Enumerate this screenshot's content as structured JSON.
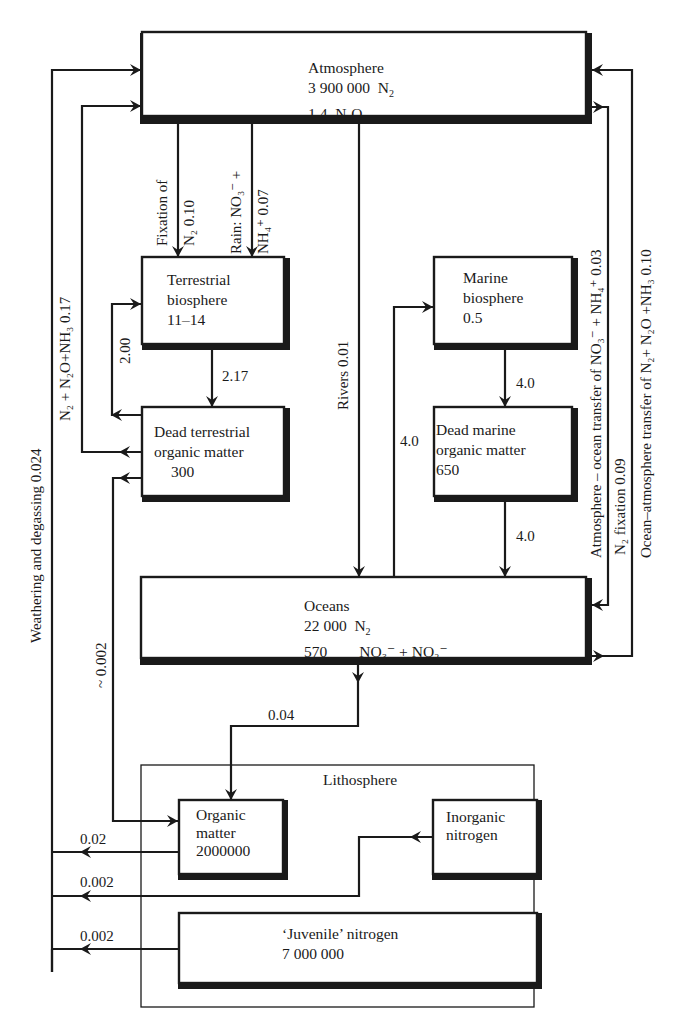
{
  "diagram": {
    "reservoirs": {
      "atmosphere": {
        "name": "Atmosphere",
        "lines": [
          {
            "value": "3 900 000",
            "species": "N",
            "sub": "2",
            "tail": ""
          },
          {
            "value": "1.4",
            "species": "N",
            "sub": "2",
            "tail": "O"
          }
        ]
      },
      "terrestrial_biosphere": {
        "line1": "Terrestrial",
        "line2": "biosphere",
        "value": "11–14"
      },
      "dead_terrestrial": {
        "line1": "Dead terrestrial",
        "line2": "organic matter",
        "value": "300"
      },
      "marine_biosphere": {
        "line1": "Marine",
        "line2": "biosphere",
        "value": "0.5"
      },
      "dead_marine": {
        "line1": "Dead marine",
        "line2": "organic matter",
        "value": "650"
      },
      "oceans": {
        "name": "Oceans",
        "n2_value": "22 000",
        "n2_label": "N",
        "n2_sub": "2",
        "nox_value": "570",
        "nox_label": "NO₃⁻ + NO₂⁻"
      },
      "lithosphere": {
        "name": "Lithosphere"
      },
      "organic_matter": {
        "line1": "Organic",
        "line2": "matter",
        "value": "2000000"
      },
      "inorganic_nitrogen": {
        "line1": "Inorganic",
        "line2": "nitrogen"
      },
      "juvenile_nitrogen": {
        "name": "‘Juvenile’ nitrogen",
        "value": "7 000 000"
      }
    },
    "flows": {
      "fixation": {
        "line1": "Fixation of",
        "line2": "N₂ 0.10"
      },
      "rain": {
        "line1": "Rain: NO₃⁻ +",
        "line2": "NH₄⁺  0.07"
      },
      "rivers": "Rivers 0.01",
      "bio_to_dead_terrestrial": "2.17",
      "dead_terrestrial_to_bio": "2.00",
      "denitrification_land": "N₂ + N₂O+NH₃ 0.17",
      "weathering": "Weathering and degassing 0.024",
      "dead_terrestrial_to_litho": "~ 0.002",
      "marine_bio_to_dead": "4.0",
      "dead_marine_to_ocean": "4.0",
      "ocean_to_marine_bio": "4.0",
      "ocean_to_litho": "0.04",
      "atm_ocean_transfer": "Atmosphere – ocean transfer of NO₃⁻ + NH₄⁺ 0.03",
      "n2_fixation_marine": "N₂ fixation 0.09",
      "ocean_atm_transfer": "Ocean–atmosphere transfer of N₂+ N₂O +NH₃ 0.10",
      "organic_weathering": "0.02",
      "inorganic_weathering": "0.002",
      "juvenile_degassing": "0.002"
    }
  }
}
